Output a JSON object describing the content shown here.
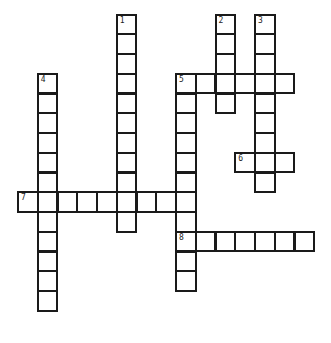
{
  "puzzle": {
    "type": "crossword",
    "grid": {
      "origin_x": 17,
      "origin_y": 13.5,
      "pitch": 19.75
    },
    "words": [
      {
        "number": "1",
        "direction": "down",
        "row": 0,
        "col": 5,
        "length": 11
      },
      {
        "number": "2",
        "direction": "down",
        "row": 0,
        "col": 10,
        "length": 5
      },
      {
        "number": "3",
        "direction": "down",
        "row": 0,
        "col": 12,
        "length": 9
      },
      {
        "number": "4",
        "direction": "down",
        "row": 3,
        "col": 1,
        "length": 12
      },
      {
        "number": "5",
        "direction": "across",
        "row": 3,
        "col": 8,
        "length": 6
      },
      {
        "number": "5",
        "direction": "down",
        "row": 3,
        "col": 8,
        "length": 11
      },
      {
        "number": "6",
        "direction": "across",
        "row": 7,
        "col": 11,
        "length": 3
      },
      {
        "number": "7",
        "direction": "across",
        "row": 9,
        "col": 0,
        "length": 9
      },
      {
        "number": "8",
        "direction": "across",
        "row": 11,
        "col": 8,
        "length": 7
      }
    ],
    "colors": {
      "border": "#1a1a1a",
      "cell": "#ffffff",
      "background": "#ffffff"
    }
  }
}
